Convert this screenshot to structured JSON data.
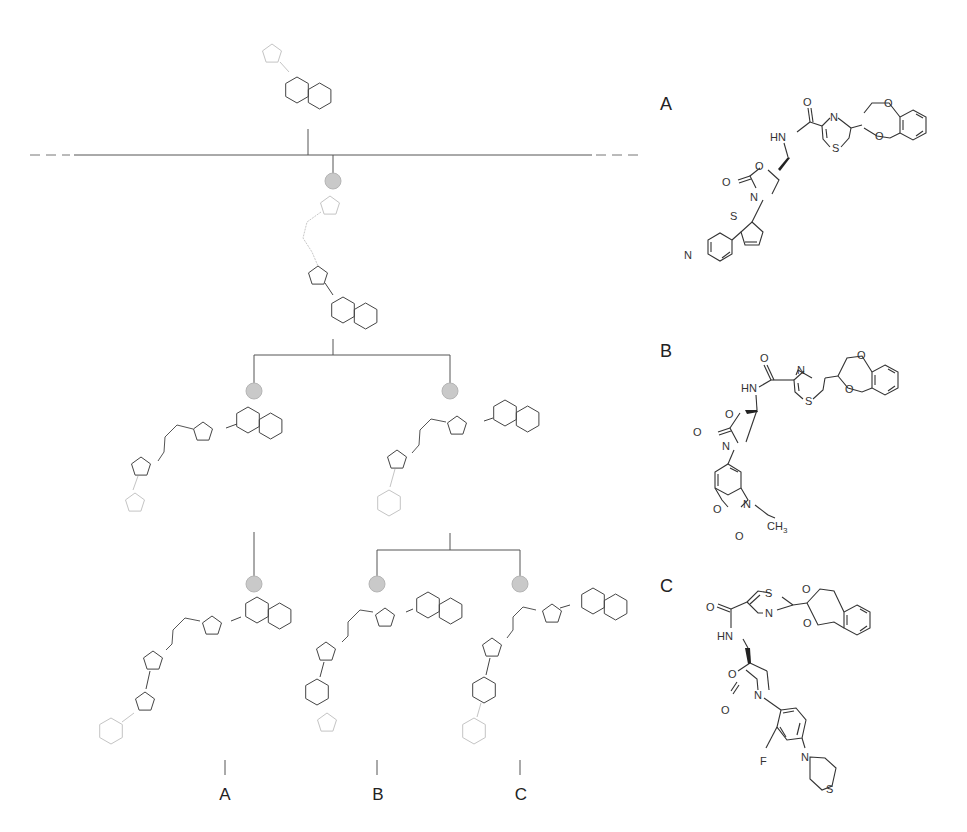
{
  "figure": {
    "type": "scaffold-tree-diagram",
    "colors": {
      "edge": "#555555",
      "ring_active": "#444444",
      "ring_faint": "#c4c4c4",
      "node_fill": "#c9c9c9",
      "text": "#222222"
    }
  },
  "tree": {
    "root": {
      "description": "cyclopentyl-naphthalene scaffold (faint pentagon + fused bicyclic)"
    },
    "levels": [
      {
        "level": 1,
        "nodes": [
          "pentagon-linker-pentagon-bicyclic"
        ]
      },
      {
        "level": 2,
        "nodes": [
          "left: bicyclic-pentagon-linker-pentagon-pentagon",
          "right: bicyclic-pentagon-linker-pentagon-hexagon"
        ]
      },
      {
        "level": 3,
        "nodes": [
          "A: ...-pentagon-pentagon-hexagon",
          "B: ...-pentagon-hexagon-fused-pentagon",
          "C: ...-pentagon-hexagon-hexagon"
        ]
      }
    ],
    "leaf_labels": [
      "A",
      "B",
      "C"
    ]
  },
  "panels": [
    {
      "label": "A",
      "atoms": [
        "O",
        "HN",
        "N",
        "S",
        "O",
        "O",
        "O",
        "O",
        "N",
        "S",
        "N"
      ],
      "description": "oxazolidinone with thiophene–pyridine aryl, thiazole carboxamide, benzodioxane"
    },
    {
      "label": "B",
      "atoms": [
        "O",
        "HN",
        "N",
        "S",
        "O",
        "O",
        "O",
        "O",
        "N",
        "O",
        "N",
        "CH3",
        "O"
      ],
      "ch3": {
        "main": "CH",
        "sub": "3"
      },
      "description": "oxazolidinone with N-ethyl benzoxazolone aryl, thiazole carboxamide, benzodioxane"
    },
    {
      "label": "C",
      "atoms": [
        "S",
        "O",
        "N",
        "HN",
        "O",
        "O",
        "O",
        "O",
        "N",
        "F",
        "N",
        "S"
      ],
      "description": "oxazolidinone with 3-fluoro-4-thiomorpholinophenyl, thiazole carboxamide, benzodioxane"
    }
  ],
  "text": {
    "leaf_A": "A",
    "leaf_B": "B",
    "leaf_C": "C",
    "panel_A": "A",
    "panel_B": "B",
    "panel_C": "C",
    "atom_O": "O",
    "atom_N": "N",
    "atom_S": "S",
    "atom_HN": "HN",
    "atom_F": "F",
    "atom_CH": "CH",
    "atom_3": "3"
  }
}
